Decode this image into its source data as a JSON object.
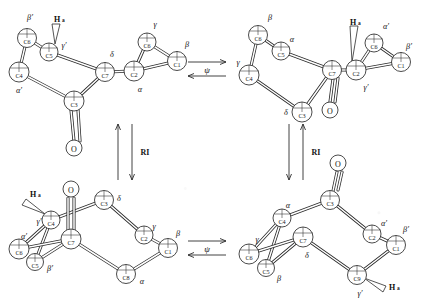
{
  "figure": {
    "type": "chemical-conformation-scheme",
    "panels": [
      {
        "id": "top-left",
        "name": "conformer-A",
        "hydrogen_label": "H",
        "hydrogen_subscript": "a",
        "carbonyl_label": "O",
        "atoms": [
          {
            "id": "C6",
            "label": "C6",
            "greek": "β′",
            "x": 27,
            "y": 38,
            "r": 9.5,
            "greek_x": 30,
            "greek_y": 17
          },
          {
            "id": "C5",
            "label": "C5",
            "greek": "γ′",
            "x": 49,
            "y": 52,
            "r": 9.0,
            "greek_x": 64,
            "greek_y": 45
          },
          {
            "id": "C4",
            "label": "C4",
            "greek": "α′",
            "x": 19,
            "y": 72,
            "r": 10.0,
            "greek_x": 19,
            "greek_y": 90
          },
          {
            "id": "C3",
            "label": "C3",
            "greek": "",
            "x": 74,
            "y": 101,
            "r": 10.0,
            "greek_x": 0,
            "greek_y": 0
          },
          {
            "id": "C7",
            "label": "C7",
            "greek": "δ",
            "x": 105,
            "y": 72,
            "r": 9.5,
            "greek_x": 112,
            "greek_y": 54
          },
          {
            "id": "C2",
            "label": "C2",
            "greek": "α",
            "x": 134,
            "y": 71,
            "r": 10.0,
            "greek_x": 140,
            "greek_y": 89
          },
          {
            "id": "C6b",
            "label": "C6",
            "greek": "γ",
            "x": 147,
            "y": 42,
            "r": 9.0,
            "greek_x": 155,
            "greek_y": 24
          },
          {
            "id": "C1",
            "label": "C1",
            "greek": "β",
            "x": 177,
            "y": 61,
            "r": 9.5,
            "greek_x": 187,
            "greek_y": 44
          }
        ],
        "oxygen": {
          "x": 74,
          "y": 148,
          "r": 8.0
        },
        "hydrogen": {
          "x": 58,
          "y": 19
        }
      },
      {
        "id": "top-right",
        "name": "conformer-B",
        "hydrogen_label": "H",
        "hydrogen_subscript": "a",
        "carbonyl_label": "O",
        "atoms": [
          {
            "id": "C6",
            "label": "C6",
            "greek": "β",
            "x": 258,
            "y": 35,
            "r": 9.5,
            "greek_x": 270,
            "greek_y": 17
          },
          {
            "id": "C5",
            "label": "C5",
            "greek": "α",
            "x": 281,
            "y": 51,
            "r": 9.0,
            "greek_x": 291,
            "greek_y": 40
          },
          {
            "id": "C4",
            "label": "C4",
            "greek": "γ",
            "x": 249,
            "y": 75,
            "r": 10.0,
            "greek_x": 239,
            "greek_y": 62
          },
          {
            "id": "C3",
            "label": "C3",
            "greek": "δ",
            "x": 302,
            "y": 112,
            "r": 10.0,
            "greek_x": 286,
            "greek_y": 112
          },
          {
            "id": "C7",
            "label": "C7",
            "greek": "",
            "x": 332,
            "y": 70,
            "r": 9.5,
            "greek_x": 0,
            "greek_y": 0
          },
          {
            "id": "C2",
            "label": "C2",
            "greek": "γ′",
            "x": 356,
            "y": 70,
            "r": 10.0,
            "greek_x": 366,
            "greek_y": 87
          },
          {
            "id": "C6b",
            "label": "C6",
            "greek": "α′",
            "x": 374,
            "y": 43,
            "r": 9.0,
            "greek_x": 385,
            "greek_y": 26
          },
          {
            "id": "C1",
            "label": "C1",
            "greek": "β′",
            "x": 401,
            "y": 62,
            "r": 9.5,
            "greek_x": 408,
            "greek_y": 46
          }
        ],
        "oxygen": {
          "x": 330,
          "y": 110,
          "r": 8.0
        },
        "hydrogen": {
          "x": 354,
          "y": 22
        }
      },
      {
        "id": "bottom-left",
        "name": "conformer-C",
        "hydrogen_label": "H",
        "hydrogen_subscript": "a",
        "carbonyl_label": "O",
        "atoms": [
          {
            "id": "C4",
            "label": "C4",
            "greek": "γ′",
            "x": 51,
            "y": 220,
            "r": 9.0,
            "greek_x": 39,
            "greek_y": 221
          },
          {
            "id": "C6",
            "label": "C6",
            "greek": "α′",
            "x": 19,
            "y": 249,
            "r": 10.0,
            "greek_x": 24,
            "greek_y": 237
          },
          {
            "id": "C5",
            "label": "C5",
            "greek": "β′",
            "x": 35,
            "y": 262,
            "r": 8.5,
            "greek_x": 49,
            "greek_y": 267
          },
          {
            "id": "C7",
            "label": "C7",
            "greek": "",
            "x": 71,
            "y": 239,
            "r": 10.0,
            "greek_x": 0,
            "greek_y": 0
          },
          {
            "id": "C3",
            "label": "C3",
            "greek": "δ",
            "x": 104,
            "y": 200,
            "r": 9.5,
            "greek_x": 119,
            "greek_y": 198
          },
          {
            "id": "C2",
            "label": "C2",
            "greek": "γ",
            "x": 144,
            "y": 235,
            "r": 9.0,
            "greek_x": 153,
            "greek_y": 226
          },
          {
            "id": "C8",
            "label": "C8",
            "greek": "α",
            "x": 126,
            "y": 274,
            "r": 9.5,
            "greek_x": 141,
            "greek_y": 280
          },
          {
            "id": "C1",
            "label": "C1",
            "greek": "β",
            "x": 168,
            "y": 248,
            "r": 9.5,
            "greek_x": 177,
            "greek_y": 233
          }
        ],
        "oxygen": {
          "x": 71,
          "y": 189,
          "r": 8.0
        },
        "hydrogen": {
          "x": 35,
          "y": 194
        }
      },
      {
        "id": "bottom-right",
        "name": "conformer-D",
        "hydrogen_label": "H",
        "hydrogen_subscript": "a",
        "carbonyl_label": "O",
        "atoms": [
          {
            "id": "C4",
            "label": "C4",
            "greek": "α",
            "x": 282,
            "y": 218,
            "r": 9.0,
            "greek_x": 288,
            "greek_y": 206
          },
          {
            "id": "C6",
            "label": "C6",
            "greek": "γ",
            "x": 249,
            "y": 254,
            "r": 10.0,
            "greek_x": 256,
            "greek_y": 239
          },
          {
            "id": "C5",
            "label": "C5",
            "greek": "β",
            "x": 266,
            "y": 268,
            "r": 8.5,
            "greek_x": 278,
            "greek_y": 277
          },
          {
            "id": "C7",
            "label": "C7",
            "greek": "δ",
            "x": 303,
            "y": 237,
            "r": 10.0,
            "greek_x": 307,
            "greek_y": 254
          },
          {
            "id": "C3",
            "label": "C3",
            "greek": "",
            "x": 330,
            "y": 200,
            "r": 9.5,
            "greek_x": 0,
            "greek_y": 0
          },
          {
            "id": "C2",
            "label": "C2",
            "greek": "α′",
            "x": 372,
            "y": 234,
            "r": 9.0,
            "greek_x": 383,
            "greek_y": 223
          },
          {
            "id": "C9",
            "label": "C9",
            "greek": "γ′",
            "x": 357,
            "y": 275,
            "r": 9.5,
            "greek_x": 360,
            "greek_y": 292
          },
          {
            "id": "C1",
            "label": "C1",
            "greek": "β′",
            "x": 396,
            "y": 245,
            "r": 9.5,
            "greek_x": 404,
            "greek_y": 229
          }
        ],
        "oxygen": {
          "x": 338,
          "y": 163,
          "r": 8.0
        },
        "hydrogen": {
          "x": 393,
          "y": 285
        }
      }
    ],
    "arrows": {
      "psi_label": "ψ",
      "ring_inversion_label": "RI",
      "top_psi": {
        "x": 201,
        "y": 69
      },
      "bottom_psi": {
        "x": 201,
        "y": 248
      },
      "left_ri": {
        "x": 140,
        "y": 152
      },
      "right_ri": {
        "x": 311,
        "y": 152
      }
    }
  }
}
